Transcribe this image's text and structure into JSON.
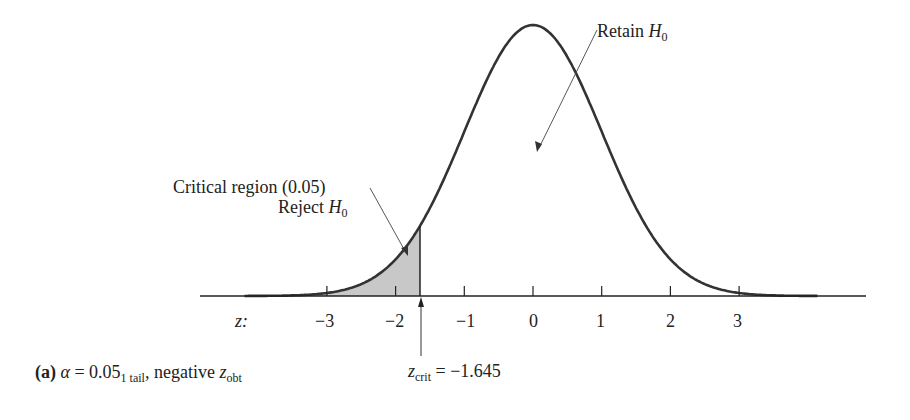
{
  "chart_data": {
    "type": "area",
    "title": "",
    "distribution": "standard normal",
    "xlabel": "z:",
    "ylabel": "",
    "x_ticks": [
      -3,
      -2,
      -1,
      0,
      1,
      2,
      3
    ],
    "x_tick_labels": [
      "−3",
      "−2",
      "−1",
      "0",
      "1",
      "2",
      "3"
    ],
    "xlim": [
      -4.2,
      4.2
    ],
    "mean": 0,
    "sd": 1,
    "shaded_region": {
      "from": -4.2,
      "to": -1.645,
      "area": 0.05,
      "color": "#c8c8c8"
    },
    "critical_value": -1.645,
    "grid": false,
    "legend": null,
    "annotations": [
      {
        "text": "Retain H0",
        "points_to": "center region"
      },
      {
        "text": "Critical region (0.05)",
        "points_to": "shaded tail"
      },
      {
        "text": "Reject H0",
        "points_to": "shaded tail"
      },
      {
        "text": "z_crit = −1.645",
        "points_to": "z = -1.645"
      }
    ]
  },
  "labels": {
    "retain": {
      "main": "Retain ",
      "var": "H",
      "sub": "0"
    },
    "critical": "Critical region (0.05)",
    "reject": {
      "main": "Reject ",
      "var": "H",
      "sub": "0"
    },
    "z_axis": "z:",
    "ticks": [
      "−3",
      "−2",
      "−1",
      "0",
      "1",
      "2",
      "3"
    ],
    "zcrit": {
      "var": "z",
      "sub": "crit",
      "value": " = −1.645"
    },
    "caption": {
      "tag": "(a)",
      "alpha": "α",
      "eq": " = 0.05",
      "sub": "1 tail",
      "rest": ", negative ",
      "var": "z",
      "var_sub": "obt"
    }
  },
  "colors": {
    "curve": "#333333",
    "shade": "#c8c8c8",
    "axis": "#222222"
  }
}
